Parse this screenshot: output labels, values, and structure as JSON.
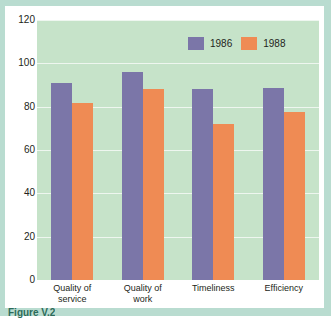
{
  "figure": {
    "caption": "Figure V.2"
  },
  "colors": {
    "series_1986": "#7b76a8",
    "series_1988": "#ef8b54",
    "plot_background": "#c6e3c9",
    "panel_background": "#b9dcd0",
    "card_background": "#ffffff",
    "gridline": "#eef6ef",
    "text": "#231f20"
  },
  "legend": {
    "position": "top-right",
    "items": [
      {
        "label": "1986",
        "color": "#7b76a8",
        "swatch_name": "legend-swatch-1986"
      },
      {
        "label": "1988",
        "color": "#ef8b54",
        "swatch_name": "legend-swatch-1988"
      }
    ]
  },
  "chart_data": {
    "type": "bar",
    "title": "",
    "xlabel": "",
    "ylabel": "",
    "ylim": [
      0,
      120
    ],
    "yticks": [
      120,
      100,
      80,
      60,
      40,
      20,
      0
    ],
    "grid": true,
    "categories": [
      "Quality of service",
      "Quality of work",
      "Timeliness",
      "Efficiency"
    ],
    "category_lines": [
      [
        "Quality of",
        "service"
      ],
      [
        "Quality of",
        "work"
      ],
      [
        "Timeliness",
        ""
      ],
      [
        "Efficiency",
        ""
      ]
    ],
    "series": [
      {
        "name": "1986",
        "color": "#7b76a8",
        "values": [
          91,
          96,
          88,
          88.5
        ]
      },
      {
        "name": "1988",
        "color": "#ef8b54",
        "values": [
          81.5,
          88,
          72,
          77.5
        ]
      }
    ]
  }
}
